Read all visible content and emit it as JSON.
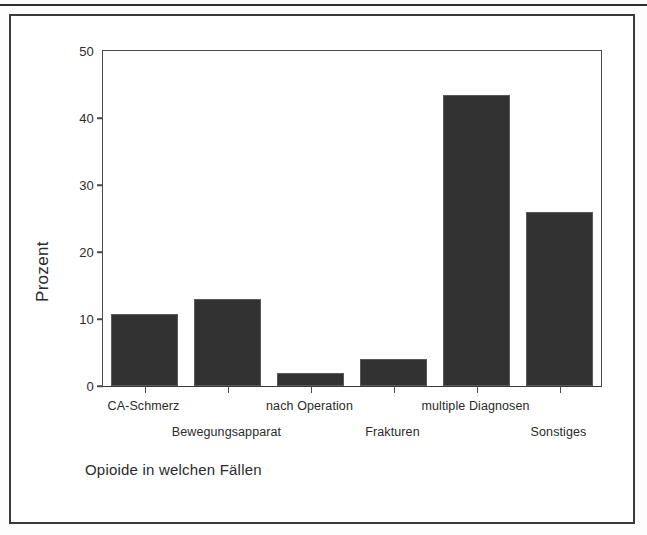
{
  "figure": {
    "caption": "Opioide in welchen Fällen"
  },
  "chart_data": {
    "type": "bar",
    "title": "",
    "subtitle": "",
    "caption": "Opioide in welchen Fällen",
    "xlabel": "",
    "ylabel": "Prozent",
    "categories": [
      "CA-Schmerz",
      "Bewegungsapparat",
      "nach Operation",
      "Frakturen",
      "multiple Diagnosen",
      "Sonstiges"
    ],
    "values": [
      10.8,
      13.0,
      2.0,
      4.0,
      43.5,
      26.0
    ],
    "ylim": [
      0,
      50
    ],
    "yticks": [
      0,
      10,
      20,
      30,
      40,
      50
    ],
    "ytick_labels": [
      "0",
      "10",
      "20",
      "30",
      "40",
      "50"
    ],
    "grid": false,
    "legend": null,
    "bar_color": "#333232",
    "bar_edge_color": "#5a5a5a",
    "axis_color": "#4a4a4a",
    "text_color": "#2b2b2b",
    "label_rows": [
      0,
      1,
      0,
      1,
      0,
      1
    ]
  }
}
